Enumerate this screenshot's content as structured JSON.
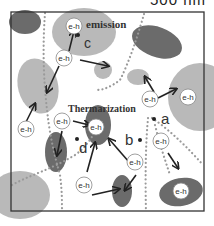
{
  "scale_bar": {
    "label": "500 nm"
  },
  "labels": {
    "emission": "emission",
    "thermalization": "Thermarization",
    "carrier": "e-h",
    "point_a": "a",
    "point_b": "b",
    "point_c": "c",
    "point_d": "d"
  },
  "colors": {
    "dark_domain": "#6b6b6b",
    "light_domain": "#b9b9b9",
    "dots": "#9a9a9a",
    "frame": "#333333",
    "arrow": "#222222"
  }
}
